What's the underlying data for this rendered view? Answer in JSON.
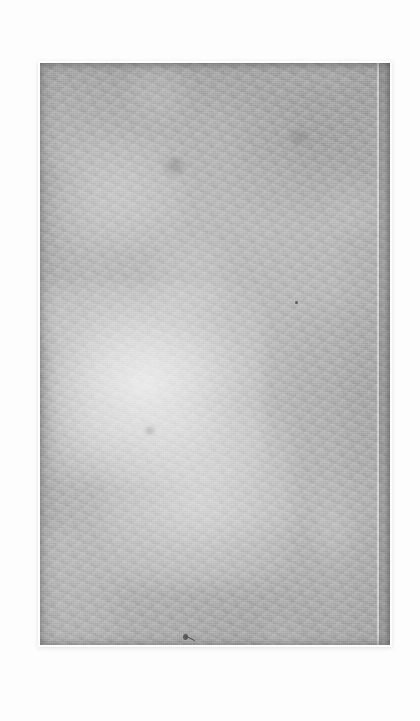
{
  "document": {
    "title": "Scanned page",
    "kind": "blank-scanned-page",
    "text_content": "",
    "page_label": "",
    "caption": ""
  },
  "scan": {
    "background_color": "#fdfdfd",
    "page_color": "#adadad",
    "page_highlight_color": "#e8e8e8",
    "page_edge_shadow_color": "#6e6e6e",
    "ink_speck_color": "#5d5d5d"
  },
  "page_geometry": {
    "left": 40,
    "top": 63,
    "width": 350,
    "height": 582,
    "gutter_line_x": 377,
    "right_edge_x": 390,
    "bottom_edge_y": 645
  },
  "marks": [
    {
      "name": "ink-speck-upper-center",
      "x": 296,
      "y": 302,
      "size": 3
    },
    {
      "name": "ink-blot-lower-center",
      "x": 184,
      "y": 637,
      "size": 5
    },
    {
      "name": "paper-smudge-upper-left",
      "x": 174,
      "y": 167,
      "size": 22
    },
    {
      "name": "paper-smudge-mid-left",
      "x": 150,
      "y": 432,
      "size": 8
    },
    {
      "name": "paper-smudge-upper-right",
      "x": 300,
      "y": 143,
      "size": 16
    }
  ],
  "regions": [
    {
      "name": "top-shadow-band",
      "tone": "dark"
    },
    {
      "name": "center-left-highlight",
      "tone": "light"
    },
    {
      "name": "right-gutter-strip",
      "tone": "dark"
    },
    {
      "name": "bottom-shadow-band",
      "tone": "dark"
    }
  ]
}
